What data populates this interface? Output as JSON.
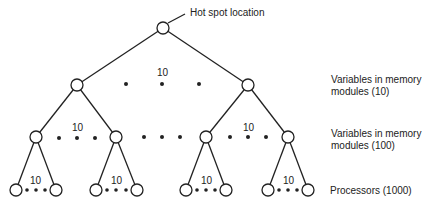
{
  "diagram": {
    "annotation": "Hot spot location",
    "levels": [
      {
        "label": "Variables in memory modules (10)",
        "line1": "Variables in memory",
        "line2": "modules (10)"
      },
      {
        "label": "Variables in memory modules (100)",
        "line1": "Variables in memory",
        "line2": "modules (100)"
      },
      {
        "label": "Processors (1000)",
        "line1": "Processors (1000)"
      }
    ],
    "fanout_labels": {
      "level1": "10",
      "level2_left": "10",
      "level2_right": "10",
      "leaf_1": "10",
      "leaf_2": "10",
      "leaf_3": "10",
      "leaf_4": "10"
    }
  }
}
